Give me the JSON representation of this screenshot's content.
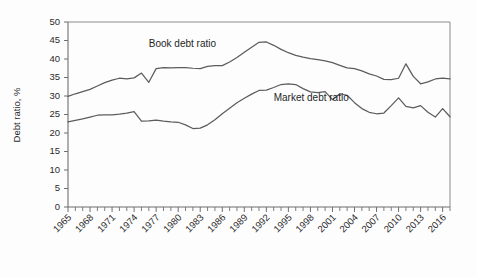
{
  "chart_data": {
    "type": "line",
    "title": "",
    "subtitle": "",
    "xlabel": "",
    "ylabel": "Debt ratio, %",
    "ylim": [
      0,
      50
    ],
    "xlim": [
      1965,
      2017
    ],
    "y_ticks": [
      0,
      5,
      10,
      15,
      20,
      25,
      30,
      35,
      40,
      45,
      50
    ],
    "x_ticks_labeled": [
      1965,
      1968,
      1971,
      1974,
      1977,
      1980,
      1983,
      1986,
      1989,
      1992,
      1995,
      1998,
      2001,
      2004,
      2007,
      2010,
      2013,
      2016
    ],
    "x_tick_step_minor": 1,
    "grid": false,
    "legend_position": "inline-annotation",
    "x": [
      1965,
      1966,
      1967,
      1968,
      1969,
      1970,
      1971,
      1972,
      1973,
      1974,
      1975,
      1976,
      1977,
      1978,
      1979,
      1980,
      1981,
      1982,
      1983,
      1984,
      1985,
      1986,
      1987,
      1988,
      1989,
      1990,
      1991,
      1992,
      1993,
      1994,
      1995,
      1996,
      1997,
      1998,
      1999,
      2000,
      2001,
      2002,
      2003,
      2004,
      2005,
      2006,
      2007,
      2008,
      2009,
      2010,
      2011,
      2012,
      2013,
      2014,
      2015,
      2016,
      2017
    ],
    "series": [
      {
        "name": "Book debt ratio",
        "label": "Book debt ratio",
        "color": "#5c5c60",
        "values": [
          29.9,
          30.6,
          31.2,
          31.8,
          32.7,
          33.6,
          34.3,
          34.8,
          34.6,
          34.9,
          36.2,
          33.7,
          37.4,
          37.7,
          37.6,
          37.7,
          37.7,
          37.5,
          37.4,
          38.0,
          38.2,
          38.2,
          39.2,
          40.4,
          41.8,
          43.2,
          44.5,
          44.6,
          43.7,
          42.6,
          41.7,
          41.0,
          40.5,
          40.1,
          39.8,
          39.5,
          39.0,
          38.3,
          37.6,
          37.4,
          36.8,
          36.0,
          35.4,
          34.5,
          34.4,
          34.8,
          38.7,
          35.3,
          33.3,
          33.8,
          34.6,
          34.8,
          34.6
        ],
        "annotation_x": 1976,
        "annotation_y": 43.2
      },
      {
        "name": "Market debt ratio",
        "label": "Market debt ratio",
        "color": "#5c5c60",
        "values": [
          23.0,
          23.4,
          23.8,
          24.3,
          24.8,
          24.9,
          24.9,
          25.1,
          25.4,
          25.8,
          23.2,
          23.3,
          23.5,
          23.2,
          23.0,
          22.9,
          22.2,
          21.2,
          21.3,
          22.2,
          23.6,
          25.2,
          26.7,
          28.2,
          29.4,
          30.5,
          31.5,
          31.6,
          32.3,
          33.1,
          33.3,
          33.1,
          32.0,
          31.1,
          30.9,
          31.2,
          29.0,
          30.6,
          30.2,
          28.2,
          26.6,
          25.6,
          25.2,
          25.4,
          27.4,
          29.5,
          27.2,
          26.8,
          27.4,
          25.6,
          24.3,
          26.6,
          24.4
        ],
        "annotation_x": 1993,
        "annotation_y": 28.6
      }
    ]
  },
  "figure": {
    "y_axis_title": "Debt ratio, %"
  }
}
